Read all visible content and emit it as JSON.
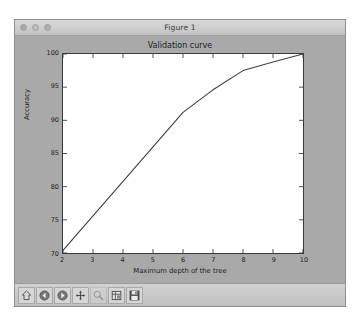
{
  "window": {
    "title": "Figure 1",
    "controls": [
      {
        "name": "close-button",
        "color": "#a8a8a8"
      },
      {
        "name": "minimize-button",
        "color": "#bcbcbc"
      },
      {
        "name": "zoom-button",
        "color": "#b0b0b0"
      }
    ]
  },
  "toolbar": {
    "buttons": [
      {
        "name": "home-button",
        "icon": "home-icon",
        "label": "Home",
        "enabled": true
      },
      {
        "name": "back-button",
        "icon": "back-arrow-icon",
        "label": "Back",
        "enabled": true
      },
      {
        "name": "forward-button",
        "icon": "forward-arrow-icon",
        "label": "Forward",
        "enabled": true
      },
      {
        "name": "pan-button",
        "icon": "move-cross-icon",
        "label": "Pan",
        "enabled": true
      },
      {
        "name": "zoom-rect-button",
        "icon": "magnifier-icon",
        "label": "Zoom to rectangle",
        "enabled": false
      },
      {
        "name": "configure-subplots-button",
        "icon": "sliders-icon",
        "label": "Configure subplots",
        "enabled": true
      },
      {
        "name": "save-figure-button",
        "icon": "floppy-disk-icon",
        "label": "Save the figure",
        "enabled": true
      }
    ]
  },
  "colors": {
    "desktop": "#ffffff",
    "window_bg": "#a9a9a9",
    "titlebar": "#cfcfcf",
    "plot_bg": "#ffffff",
    "line": "#3f3f3f",
    "axis": "#3a3a3a",
    "text": "#1d1d1d"
  },
  "chart_data": {
    "type": "line",
    "title": "Validation curve",
    "xlabel": "Maximum depth of the tree",
    "ylabel": "Accuracy",
    "xlim": [
      2,
      10
    ],
    "ylim": [
      70,
      100
    ],
    "xticks": [
      2,
      3,
      4,
      5,
      6,
      7,
      8,
      9,
      10
    ],
    "xticklabels": [
      "2",
      "3",
      "4",
      "5",
      "6",
      "7",
      "8",
      "9",
      "10"
    ],
    "yticks": [
      70,
      75,
      80,
      85,
      90,
      95,
      100
    ],
    "yticklabels": [
      "70",
      "75",
      "80",
      "85",
      "90",
      "95",
      "100"
    ],
    "grid": false,
    "legend": null,
    "series": [
      {
        "name": "validation accuracy",
        "color": "#3f3f3f",
        "x": [
          2,
          3,
          4,
          5,
          6,
          7,
          8,
          9,
          10
        ],
        "y": [
          70.4,
          75.6,
          80.8,
          86.0,
          91.2,
          94.6,
          97.5,
          98.8,
          100.0
        ]
      }
    ]
  }
}
